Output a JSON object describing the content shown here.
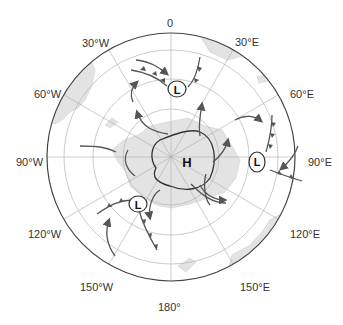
{
  "map": {
    "type": "south-polar-stereographic",
    "center_symbol": "H",
    "pressure_systems": [
      {
        "label": "H",
        "kind": "high",
        "location": "center (Antarctica)"
      },
      {
        "label": "L",
        "kind": "low",
        "location": "near 0°/30°E"
      },
      {
        "label": "L",
        "kind": "low",
        "location": "near 90°E"
      },
      {
        "label": "L",
        "kind": "low",
        "location": "near 120°W-150°W"
      }
    ],
    "longitude_labels": {
      "n0": "0",
      "e30": "30°E",
      "e60": "60°E",
      "e90": "90°E",
      "e120": "120°E",
      "e150": "150°E",
      "s180": "180°",
      "w150": "150°W",
      "w120": "120°W",
      "w90": "90°W",
      "w60": "60°W",
      "w30": "30°W"
    },
    "colors": {
      "land": "#e3e3e3",
      "land_edge": "#c8c8c8",
      "grid": "#b5b5b5",
      "outer_circle": "#444444",
      "front": "#555555",
      "arrow": "#555555",
      "isobar": "#333333"
    }
  }
}
